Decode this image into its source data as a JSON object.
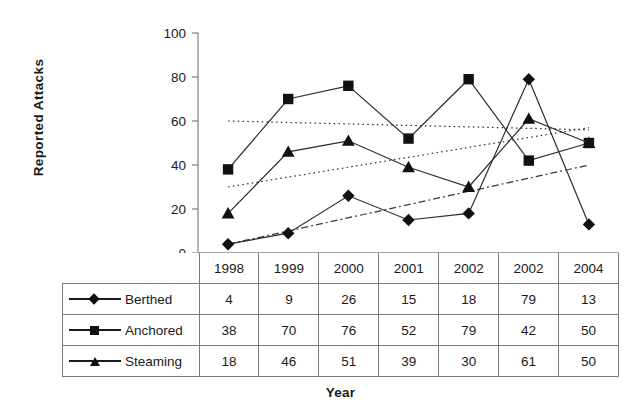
{
  "chart_data": {
    "type": "line",
    "title": "",
    "xlabel": "Year",
    "ylabel": "Reported Attacks",
    "categories": [
      "1998",
      "1999",
      "2000",
      "2001",
      "2002",
      "2002",
      "2004"
    ],
    "ylim": [
      0,
      100
    ],
    "yticks": [
      0,
      20,
      40,
      60,
      80,
      100
    ],
    "grid": false,
    "legend_position": "table-left",
    "series": [
      {
        "name": "Berthed",
        "marker": "diamond",
        "values": [
          4,
          9,
          26,
          15,
          18,
          79,
          13
        ],
        "trendline": {
          "style": "dash-dot",
          "start": 4,
          "end": 40
        }
      },
      {
        "name": "Anchored",
        "marker": "square",
        "values": [
          38,
          70,
          76,
          52,
          79,
          42,
          50
        ],
        "trendline": {
          "style": "dotted",
          "start": 60,
          "end": 56
        }
      },
      {
        "name": "Steaming",
        "marker": "triangle",
        "values": [
          18,
          46,
          51,
          39,
          30,
          61,
          50
        ],
        "trendline": {
          "style": "dotted",
          "start": 30,
          "end": 57
        }
      }
    ]
  },
  "table": {
    "corner_label": "",
    "year_headers": [
      "1998",
      "1999",
      "2000",
      "2001",
      "2002",
      "2002",
      "2004"
    ],
    "rows": [
      {
        "label": "Berthed",
        "marker": "diamond-marker-icon",
        "values": [
          "4",
          "9",
          "26",
          "15",
          "18",
          "79",
          "13"
        ]
      },
      {
        "label": "Anchored",
        "marker": "square-marker-icon",
        "values": [
          "38",
          "70",
          "76",
          "52",
          "79",
          "42",
          "50"
        ]
      },
      {
        "label": "Steaming",
        "marker": "triangle-marker-icon",
        "values": [
          "18",
          "46",
          "51",
          "39",
          "30",
          "61",
          "50"
        ]
      }
    ]
  },
  "axis": {
    "y_title": "Reported Attacks",
    "x_title": "Year",
    "y_tick_labels": [
      "100",
      "80",
      "60",
      "40",
      "20",
      "0"
    ]
  },
  "colors": {
    "ink": "#1a1a1a",
    "line": "#2b2b2b",
    "axis": "#8a8a8a",
    "border": "#7b7b7b",
    "background": "#ffffff"
  }
}
